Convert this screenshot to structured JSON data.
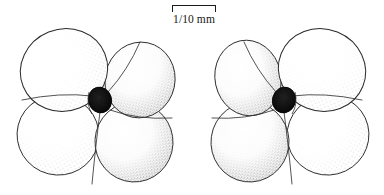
{
  "figure": {
    "kind": "scientific-line-drawing",
    "technique": "pen-and-ink stipple",
    "background_color": "#ffffff",
    "ink_color": "#1c1c1c",
    "stipple_color": "#4a4a4a",
    "umbilicus_color": "#2b2b2b",
    "specimen_count": 2
  },
  "scale_bar": {
    "label": "1/10 mm",
    "bar_length_px": 44,
    "tick_style": "downward-end-ticks",
    "position": "top-center"
  },
  "specimens": [
    {
      "id": "specimen-left",
      "view": "umbilical",
      "chamber_count": 4,
      "center": {
        "x": 100,
        "y": 108
      },
      "umbilicus": {
        "x": 100,
        "y": 100,
        "rx": 11,
        "ry": 13
      },
      "chambers": [
        {
          "name": "chamber-upper-left",
          "cx": 64,
          "cy": 70,
          "rx": 44,
          "ry": 41,
          "rot": -22
        },
        {
          "name": "chamber-upper-right",
          "cx": 140,
          "cy": 80,
          "rx": 35,
          "ry": 38,
          "rot": 12
        },
        {
          "name": "chamber-lower-left",
          "cx": 58,
          "cy": 135,
          "rx": 41,
          "ry": 40,
          "rot": 14
        },
        {
          "name": "chamber-lower-right",
          "cx": 134,
          "cy": 142,
          "rx": 39,
          "ry": 40,
          "rot": -8
        }
      ]
    },
    {
      "id": "specimen-right",
      "view": "umbilical-mirrored",
      "chamber_count": 4,
      "center": {
        "x": 284,
        "y": 108
      },
      "umbilicus": {
        "x": 284,
        "y": 100,
        "rx": 11,
        "ry": 13
      },
      "chambers": [
        {
          "name": "chamber-upper-left",
          "cx": 248,
          "cy": 78,
          "rx": 33,
          "ry": 38,
          "rot": -12
        },
        {
          "name": "chamber-upper-right",
          "cx": 322,
          "cy": 70,
          "rx": 44,
          "ry": 41,
          "rot": 22
        },
        {
          "name": "chamber-lower-left",
          "cx": 250,
          "cy": 142,
          "rx": 39,
          "ry": 40,
          "rot": 8
        },
        {
          "name": "chamber-lower-right",
          "cx": 328,
          "cy": 135,
          "rx": 41,
          "ry": 40,
          "rot": -14
        }
      ]
    }
  ]
}
